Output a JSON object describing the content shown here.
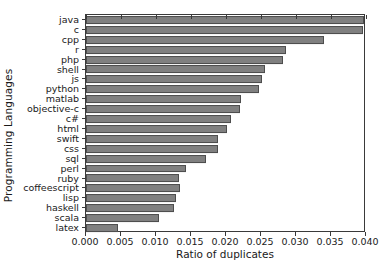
{
  "chart_data": {
    "type": "bar",
    "orientation": "horizontal",
    "title": "",
    "xlabel": "Ratio of duplicates",
    "ylabel": "Programming Languages",
    "xlim": [
      0.0,
      0.04
    ],
    "ylim": [
      0,
      22
    ],
    "grid": false,
    "legend": null,
    "bar_color": "#808080",
    "bar_edge_color": "#4d4d4d",
    "xticks": [
      "0.000",
      "0.005",
      "0.010",
      "0.015",
      "0.020",
      "0.025",
      "0.030",
      "0.035",
      "0.040"
    ],
    "xtick_values": [
      0.0,
      0.005,
      0.01,
      0.015,
      0.02,
      0.025,
      0.03,
      0.035,
      0.04
    ],
    "categories": [
      "java",
      "c",
      "cpp",
      "r",
      "php",
      "shell",
      "js",
      "python",
      "matlab",
      "objective-c",
      "c#",
      "html",
      "swift",
      "css",
      "sql",
      "perl",
      "ruby",
      "coffeescript",
      "lisp",
      "haskell",
      "scala",
      "latex"
    ],
    "values": [
      0.0397,
      0.0396,
      0.034,
      0.0286,
      0.0282,
      0.0256,
      0.0252,
      0.0247,
      0.0222,
      0.022,
      0.0207,
      0.0202,
      0.0189,
      0.0188,
      0.0172,
      0.0143,
      0.0133,
      0.0134,
      0.0128,
      0.0126,
      0.0104,
      0.0046
    ]
  }
}
